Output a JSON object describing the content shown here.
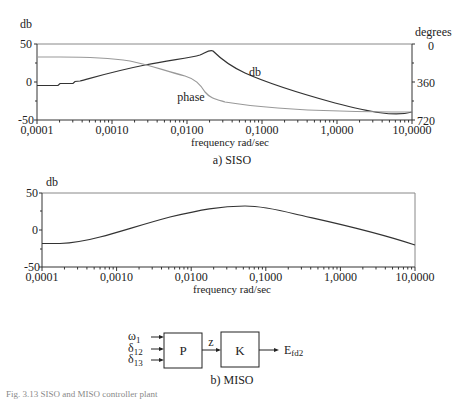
{
  "chart_data": [
    {
      "type": "line",
      "title": "a) SISO",
      "xlabel": "frequency rad/sec",
      "ylabel": "db",
      "ylabel_right": "degrees",
      "xscale": "log",
      "xlim": [
        0.0001,
        10.0
      ],
      "ylim": [
        -50,
        50
      ],
      "ylim_right": [
        720,
        0
      ],
      "x_tick_labels": [
        "0,0001",
        "0,0010",
        "0,0100",
        "0,1000",
        "1,0000",
        "10,0000"
      ],
      "y_tick_labels": [
        "50",
        "0",
        "-50"
      ],
      "y_right_tick_labels": [
        "0",
        "360",
        "720"
      ],
      "annotations": [
        "db",
        "phase"
      ],
      "grid": false,
      "series": [
        {
          "name": "db",
          "axis": "left",
          "x": [
            0.0001,
            0.0002,
            0.0003,
            0.001,
            0.003,
            0.01,
            0.015,
            0.02,
            0.03,
            0.05,
            0.1,
            0.3,
            1.0,
            3.0,
            10.0
          ],
          "values": [
            -5,
            -3,
            -1,
            7,
            15,
            25,
            32,
            40,
            30,
            17,
            4,
            -8,
            -20,
            -30,
            -38
          ]
        },
        {
          "name": "phase",
          "axis": "right",
          "x": [
            0.0001,
            0.0002,
            0.0005,
            0.001,
            0.003,
            0.01,
            0.015,
            0.02,
            0.025,
            0.03,
            0.05,
            0.1,
            0.3,
            1.0,
            10.0
          ],
          "values": [
            120,
            115,
            115,
            125,
            170,
            260,
            290,
            340,
            420,
            470,
            530,
            575,
            620,
            650,
            660
          ]
        }
      ]
    },
    {
      "type": "line",
      "title": "b) MISO",
      "xlabel": "frequency rad/sec",
      "ylabel": "db",
      "xscale": "log",
      "xlim": [
        0.0001,
        10.0
      ],
      "ylim": [
        -50,
        50
      ],
      "x_tick_labels": [
        "0,0001",
        "0,0010",
        "0,0100",
        "0,1000",
        "1,0000",
        "10,0000"
      ],
      "y_tick_labels": [
        "50",
        "0",
        "-50"
      ],
      "grid": false,
      "series": [
        {
          "name": "db",
          "x": [
            0.0001,
            0.0003,
            0.001,
            0.003,
            0.01,
            0.03,
            0.05,
            0.1,
            0.3,
            1.0,
            3.0,
            10.0
          ],
          "values": [
            -19,
            -17,
            -10,
            0,
            12,
            20,
            21,
            20,
            10,
            -2,
            -11,
            -21
          ]
        }
      ]
    }
  ],
  "plots": {
    "siso": {
      "ylabel": "db",
      "ylabel_right": "degrees",
      "xlabel": "frequency rad/sec",
      "caption": "a) SISO",
      "y_ticks": [
        "50",
        "0",
        "-50"
      ],
      "y_right_ticks": [
        "0",
        "360",
        "720"
      ],
      "x_ticks": [
        "0,0001",
        "0,0010",
        "0,0100",
        "0,1000",
        "1,0000",
        "10,0000"
      ],
      "curve_label_db": "db",
      "curve_label_phase": "phase"
    },
    "miso": {
      "ylabel": "db",
      "xlabel": "frequency rad/sec",
      "caption": "b) MISO",
      "y_ticks": [
        "50",
        "0",
        "-50"
      ],
      "x_ticks": [
        "0,0001",
        "0,0010",
        "0,0100",
        "0,1000",
        "1,0000",
        "10,0000"
      ]
    }
  },
  "block_diagram": {
    "inputs": [
      "ω1",
      "δ12",
      "δ13"
    ],
    "inputs_parts": [
      {
        "base": "ω",
        "sub": "1"
      },
      {
        "base": "δ",
        "sub": "12"
      },
      {
        "base": "δ",
        "sub": "13"
      }
    ],
    "block_p": "P",
    "signal_z": "z",
    "block_k": "K",
    "output": {
      "base": "E",
      "sub": "fd2"
    }
  },
  "footer_caption": "Fig. 3.13 SISO and MISO controller plant"
}
